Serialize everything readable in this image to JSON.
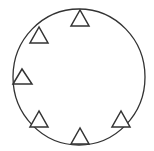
{
  "diagram": {
    "stroke_color": "#333333",
    "background": "#ffffff",
    "circle": {
      "cx": 79,
      "cy": 77,
      "rx": 66,
      "ry": 68
    },
    "triangles": [
      {
        "name": "top",
        "apex": [
          80,
          10
        ],
        "base_y": 26,
        "base_x": [
          71,
          89
        ]
      },
      {
        "name": "upper-left",
        "apex": [
          39,
          27
        ],
        "base_y": 43,
        "base_x": [
          30,
          48
        ]
      },
      {
        "name": "left",
        "apex": [
          22,
          69
        ],
        "base_y": 84,
        "base_x": [
          13,
          32
        ]
      },
      {
        "name": "lower-left",
        "apex": [
          39,
          111
        ],
        "base_y": 127,
        "base_x": [
          30,
          48
        ]
      },
      {
        "name": "bottom",
        "apex": [
          80,
          128
        ],
        "base_y": 144,
        "base_x": [
          71,
          89
        ]
      },
      {
        "name": "lower-right",
        "apex": [
          121,
          111
        ],
        "base_y": 127,
        "base_x": [
          112,
          130
        ]
      }
    ],
    "triangle_count": 6
  }
}
